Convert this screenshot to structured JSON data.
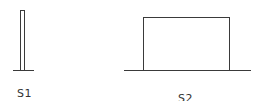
{
  "diagram": {
    "shapes": [
      {
        "id": "S1",
        "label": "S1",
        "description": "narrow tall rectangular pulse on baseline"
      },
      {
        "id": "S2",
        "label": "S2",
        "description": "wide rectangular pulse on baseline"
      }
    ],
    "stroke_color": "#3a3a3a",
    "background": "#ffffff"
  }
}
